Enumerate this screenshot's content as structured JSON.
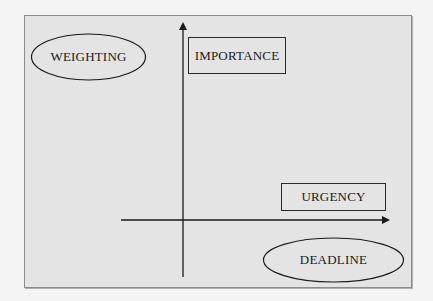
{
  "diagram": {
    "type": "quadrant-axes",
    "colors": {
      "background": "#f4f4f4",
      "frame_fill": "#e4e4e4",
      "frame_border": "#8c8c8c",
      "ink": "#1a1a1a"
    },
    "axes": {
      "vertical": {
        "direction": "up",
        "arrow": true
      },
      "horizontal": {
        "direction": "right",
        "arrow": true
      }
    },
    "ellipses": [
      {
        "id": "weighting",
        "label": "WEIGHTING"
      },
      {
        "id": "deadline",
        "label": "DEADLINE"
      }
    ],
    "boxes": [
      {
        "id": "importance",
        "label": "IMPORTANCE"
      },
      {
        "id": "urgency",
        "label": "URGENCY"
      }
    ]
  }
}
